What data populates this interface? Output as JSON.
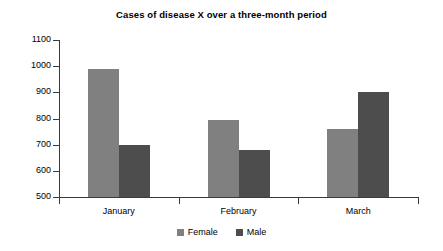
{
  "chart_data": {
    "type": "bar",
    "title": "Cases of disease X over a three-month period",
    "xlabel": "",
    "ylabel": "",
    "categories": [
      "January",
      "February",
      "March"
    ],
    "series": [
      {
        "name": "Female",
        "color": "#808080",
        "values": [
          990,
          795,
          760
        ]
      },
      {
        "name": "Male",
        "color": "#4d4d4d",
        "values": [
          697,
          680,
          900
        ]
      }
    ],
    "ylim": [
      500,
      1100
    ],
    "yticks": [
      500,
      600,
      700,
      800,
      900,
      1000,
      1100
    ],
    "ytick_labels": [
      "500",
      "600",
      "700",
      "800",
      "900",
      "1000",
      "1100"
    ],
    "grid": false,
    "legend_position": "bottom-center",
    "legend_entries": [
      "Female",
      "Male"
    ]
  }
}
